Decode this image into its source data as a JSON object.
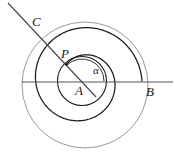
{
  "figure": {
    "background_color": "#ffffff",
    "width": 174,
    "height": 161,
    "labels": {
      "center": "A",
      "spiral_point": "P",
      "ray_end_upper_left": "C",
      "ray_end_right": "B",
      "angle": "α"
    },
    "colors": {
      "outer_circle": "#9a9a9a",
      "inner_circle": "#1a1a1a",
      "spiral": "#1a1a1a",
      "ray_line": "#444444",
      "horizontal_line": "#555555",
      "angle_arc": "#333333",
      "label_text": "#222222"
    },
    "geometry": {
      "center_A": {
        "x": 82,
        "y": 81
      },
      "point_P": {
        "x": 66.5,
        "y": 64.5
      },
      "point_B": {
        "x": 142,
        "y": 82
      },
      "point_C": {
        "x": 42,
        "y": 25
      },
      "inner_circle_radius": 24.5,
      "outer_circle_radius": 63,
      "outer_circle_center": {
        "x": 85,
        "y": 85
      },
      "angle_alpha_degrees": 133,
      "ray_start": {
        "x": 8,
        "y": 3
      },
      "ray_end": {
        "x": 96,
        "y": 97
      },
      "horizontal_line_start": {
        "x": 22,
        "y": 82
      },
      "horizontal_line_end": {
        "x": 173,
        "y": 82
      },
      "angle_arc_radius": 22
    }
  }
}
